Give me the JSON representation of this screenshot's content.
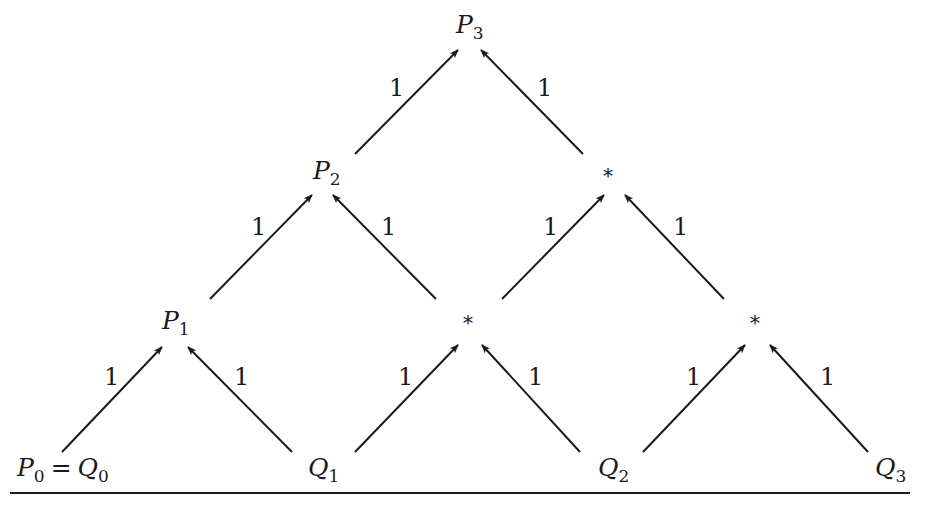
{
  "diagram": {
    "nodes": {
      "p3": {
        "var": "P",
        "sub": "3"
      },
      "p2": {
        "var": "P",
        "sub": "2"
      },
      "p1": {
        "var": "P",
        "sub": "1"
      },
      "star_l1_mid": "*",
      "star_l2_right": "*",
      "star_l1_right": "*",
      "p0": {
        "var": "P",
        "sub": "0",
        "eq": "=",
        "var2": "Q",
        "sub2": "0"
      },
      "q1": {
        "var": "Q",
        "sub": "1"
      },
      "q2": {
        "var": "Q",
        "sub": "2"
      },
      "q3": {
        "var": "Q",
        "sub": "3"
      }
    },
    "edge_weight": "1",
    "edges": [
      {
        "from": "P0=Q0",
        "to": "P1",
        "weight": "1"
      },
      {
        "from": "Q1",
        "to": "P1",
        "weight": "1"
      },
      {
        "from": "Q1",
        "to": "*(L1 mid)",
        "weight": "1"
      },
      {
        "from": "Q2",
        "to": "*(L1 mid)",
        "weight": "1"
      },
      {
        "from": "Q2",
        "to": "*(L1 right)",
        "weight": "1"
      },
      {
        "from": "Q3",
        "to": "*(L1 right)",
        "weight": "1"
      },
      {
        "from": "P1",
        "to": "P2",
        "weight": "1"
      },
      {
        "from": "*(L1 mid)",
        "to": "P2",
        "weight": "1"
      },
      {
        "from": "*(L1 mid)",
        "to": "*(L2 right)",
        "weight": "1"
      },
      {
        "from": "*(L1 right)",
        "to": "*(L2 right)",
        "weight": "1"
      },
      {
        "from": "P2",
        "to": "P3",
        "weight": "1"
      },
      {
        "from": "*(L2 right)",
        "to": "P3",
        "weight": "1"
      }
    ],
    "colors": {
      "ink": "#1a1a1a",
      "background": "#ffffff"
    }
  }
}
